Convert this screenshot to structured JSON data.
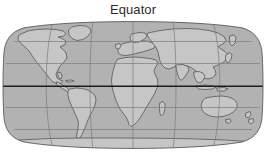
{
  "figure": {
    "title": "Equator",
    "type": "world-map",
    "projection": "robinson",
    "colors": {
      "background": "#ffffff",
      "ocean": "#b2b2b2",
      "land": "#c6c6c6",
      "coastline": "#4a4a4a",
      "graticule": "#7d7d7d",
      "equator": "#1c1c1c",
      "outline": "#5a5a5a",
      "title_text": "#2b2b2b"
    },
    "graticule": {
      "parallels_labels": [
        "60N",
        "30N",
        "0",
        "30S",
        "60S"
      ],
      "meridians_labels": [
        "120W",
        "60W",
        "0",
        "60E",
        "120E"
      ],
      "highlighted_parallel": "Equator",
      "grid_visible": true
    },
    "landmasses": [
      "North America",
      "Greenland",
      "South America",
      "Africa",
      "Madagascar",
      "Europe",
      "Asia",
      "Japan",
      "Australia",
      "Tasmania",
      "New Zealand",
      "Antarctica",
      "British Isles"
    ],
    "annotations": [
      {
        "id": "equator-label",
        "text": "Equator",
        "position": "top-center"
      }
    ]
  }
}
